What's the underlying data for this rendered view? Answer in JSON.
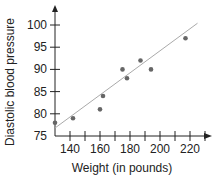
{
  "chart_data": {
    "type": "scatter",
    "title": "",
    "xlabel": "Weight (in pounds)",
    "ylabel": "Diastolic blood pressure",
    "x_ticks": [
      140,
      160,
      180,
      200,
      220
    ],
    "y_ticks": [
      75,
      80,
      85,
      90,
      95,
      100
    ],
    "xlim": [
      130,
      235
    ],
    "ylim": [
      75,
      103
    ],
    "grid": false,
    "legend": null,
    "series": [
      {
        "name": "data",
        "points": [
          {
            "x": 130,
            "y": 78
          },
          {
            "x": 142,
            "y": 79
          },
          {
            "x": 160,
            "y": 81
          },
          {
            "x": 162,
            "y": 84
          },
          {
            "x": 175,
            "y": 90
          },
          {
            "x": 178,
            "y": 88
          },
          {
            "x": 187,
            "y": 92
          },
          {
            "x": 194,
            "y": 90
          },
          {
            "x": 217,
            "y": 97
          }
        ]
      }
    ],
    "trend_line": {
      "x1": 130,
      "y1": 76.8,
      "x2": 225,
      "y2": 100.4
    },
    "colors": {
      "points": "#666666",
      "trend_line": "#aaaaaa",
      "axes": "#222222"
    }
  }
}
